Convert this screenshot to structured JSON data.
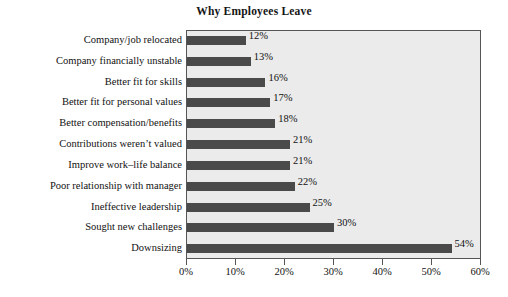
{
  "chart_data": {
    "type": "bar",
    "orientation": "horizontal",
    "title": "Why Employees Leave",
    "xlabel": "",
    "ylabel": "",
    "xlim": [
      0,
      60
    ],
    "grid": false,
    "legend": null,
    "categories": [
      "Company/job relocated",
      "Company financially unstable",
      "Better fit for skills",
      "Better fit for personal values",
      "Better compensation/benefits",
      "Contributions weren’t valued",
      "Improve work–life balance",
      "Poor relationship with manager",
      "Ineffective leadership",
      "Sought new challenges",
      "Downsizing"
    ],
    "values": [
      12,
      13,
      16,
      17,
      18,
      21,
      21,
      22,
      25,
      30,
      54
    ],
    "value_labels": [
      "12%",
      "13%",
      "16%",
      "17%",
      "18%",
      "21%",
      "21%",
      "22%",
      "25%",
      "30%",
      "54%"
    ],
    "xticks": [
      0,
      10,
      20,
      30,
      40,
      50,
      60
    ],
    "xtick_labels": [
      "0%",
      "10%",
      "20%",
      "30%",
      "40%",
      "50%",
      "60%"
    ],
    "colors": {
      "bar": "#4a4a4a",
      "plot_background": "#ebebeb",
      "page_background": "#ffffff",
      "axis": "#555555",
      "text": "#111111"
    }
  }
}
